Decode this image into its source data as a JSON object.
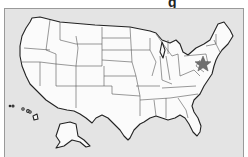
{
  "title_fragment": "g",
  "map": {
    "subject": "United States of America",
    "regions": [
      "Contiguous United States",
      "Alaska",
      "Hawaii"
    ],
    "state_fill": "#fbfbfb",
    "background": "#e4e4e4",
    "marker": {
      "icon": "star-icon",
      "location": "Pennsylvania / Maryland region",
      "color": "#6f6f6f"
    }
  }
}
